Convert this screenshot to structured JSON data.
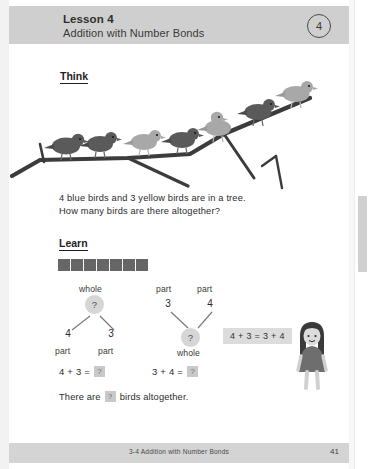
{
  "header": {
    "lesson_label": "Lesson 4",
    "lesson_subtitle": "Addition with Number Bonds",
    "chapter_badge": "4"
  },
  "sections": {
    "think_heading": "Think",
    "learn_heading": "Learn"
  },
  "problem": {
    "line1": "4 blue birds and 3 yellow birds are in a tree.",
    "line2": "How many birds are there altogether?"
  },
  "illustration": {
    "name": "birds-on-branch",
    "total_birds": 7,
    "blue_birds": 4,
    "yellow_birds": 3,
    "bird_colors": {
      "blue": "#5a5a5a",
      "yellow": "#a8a8a8"
    },
    "branch_color": "#3c3c3c"
  },
  "cube_bar": {
    "count": 7,
    "color": "#666666"
  },
  "bond_left": {
    "caption_top": "whole",
    "whole_value": "?",
    "part_a": "4",
    "part_b": "3",
    "caption_part_a": "part",
    "caption_part_b": "part"
  },
  "bond_right": {
    "caption_part_a": "part",
    "caption_part_b": "part",
    "part_a": "3",
    "part_b": "4",
    "whole_value": "?",
    "caption_bottom": "whole"
  },
  "callout": {
    "text": "4 + 3 = 3 + 4"
  },
  "equations": {
    "eq1_left": "4 + 3 =",
    "eq1_answer": "?",
    "eq2_left": "3 + 4 =",
    "eq2_answer": "?"
  },
  "summary": {
    "prefix": "There are",
    "answer": "?",
    "suffix": "birds altogether."
  },
  "footer": {
    "text": "3-4 Addition with Number Bonds",
    "page_number": "41"
  }
}
